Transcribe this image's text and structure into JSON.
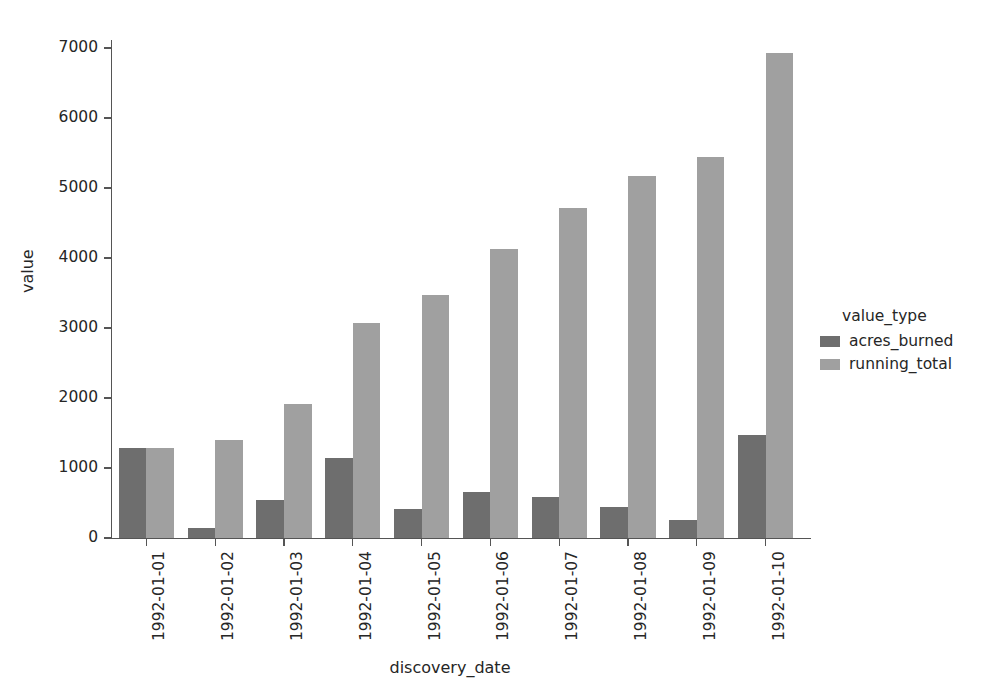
{
  "chart_data": {
    "type": "bar",
    "title": "",
    "xlabel": "discovery_date",
    "ylabel": "value",
    "categories": [
      "1992-01-01",
      "1992-01-02",
      "1992-01-03",
      "1992-01-04",
      "1992-01-05",
      "1992-01-06",
      "1992-01-07",
      "1992-01-08",
      "1992-01-09",
      "1992-01-10"
    ],
    "series": [
      {
        "name": "acres_burned",
        "color": "#6e6e6e",
        "values": [
          1290,
          150,
          550,
          1150,
          420,
          660,
          590,
          450,
          260,
          1470
        ]
      },
      {
        "name": "running_total",
        "color": "#a0a0a0",
        "values": [
          1290,
          1400,
          1920,
          3070,
          3470,
          4130,
          4715,
          5170,
          5440,
          6930
        ]
      }
    ],
    "ylim": [
      0,
      7000
    ],
    "yticks": [
      0,
      1000,
      2000,
      3000,
      4000,
      5000,
      6000,
      7000
    ],
    "ytick_labels": [
      "0",
      "1000",
      "2000",
      "3000",
      "4000",
      "5000",
      "6000",
      "7000"
    ],
    "grid": false,
    "legend": {
      "title": "value_type",
      "position": "right-outside",
      "entries": [
        {
          "label": "acres_burned",
          "color": "#6e6e6e"
        },
        {
          "label": "running_total",
          "color": "#a0a0a0"
        }
      ]
    },
    "axis_color": "#555555",
    "background": "#ffffff"
  }
}
